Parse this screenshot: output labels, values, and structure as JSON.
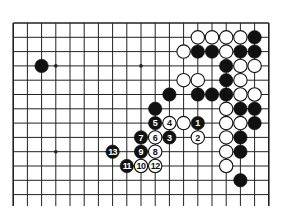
{
  "diagram": {
    "type": "go-board-partial",
    "board_columns": 19,
    "visible_rows": 13,
    "colors": {
      "black": "#111111",
      "white": "#ffffff",
      "line": "#222222",
      "background": "#ffffff"
    },
    "star_points": [
      [
        3,
        3
      ],
      [
        9,
        3
      ],
      [
        3,
        9
      ],
      [
        9,
        9
      ],
      [
        15,
        3
      ],
      [
        15,
        9
      ]
    ],
    "stones": [
      {
        "c": 2,
        "r": 3,
        "color": "black"
      },
      {
        "c": 13,
        "r": 1,
        "color": "white"
      },
      {
        "c": 14,
        "r": 1,
        "color": "white"
      },
      {
        "c": 15,
        "r": 1,
        "color": "white"
      },
      {
        "c": 16,
        "r": 1,
        "color": "white"
      },
      {
        "c": 17,
        "r": 1,
        "color": "black"
      },
      {
        "c": 12,
        "r": 2,
        "color": "white"
      },
      {
        "c": 13,
        "r": 2,
        "color": "black"
      },
      {
        "c": 14,
        "r": 2,
        "color": "black"
      },
      {
        "c": 15,
        "r": 2,
        "color": "white"
      },
      {
        "c": 16,
        "r": 2,
        "color": "black"
      },
      {
        "c": 17,
        "r": 2,
        "color": "black"
      },
      {
        "c": 15,
        "r": 3,
        "color": "black"
      },
      {
        "c": 16,
        "r": 3,
        "color": "white"
      },
      {
        "c": 17,
        "r": 3,
        "color": "white"
      },
      {
        "c": 12,
        "r": 4,
        "color": "white"
      },
      {
        "c": 13,
        "r": 4,
        "color": "white"
      },
      {
        "c": 15,
        "r": 4,
        "color": "black"
      },
      {
        "c": 16,
        "r": 4,
        "color": "white"
      },
      {
        "c": 11,
        "r": 5,
        "color": "black"
      },
      {
        "c": 13,
        "r": 5,
        "color": "black"
      },
      {
        "c": 14,
        "r": 5,
        "color": "black"
      },
      {
        "c": 15,
        "r": 5,
        "color": "black"
      },
      {
        "c": 16,
        "r": 5,
        "color": "white"
      },
      {
        "c": 17,
        "r": 5,
        "color": "white"
      },
      {
        "c": 10,
        "r": 6,
        "color": "black"
      },
      {
        "c": 15,
        "r": 6,
        "color": "white"
      },
      {
        "c": 16,
        "r": 6,
        "color": "black"
      },
      {
        "c": 17,
        "r": 6,
        "color": "black"
      },
      {
        "c": 10,
        "r": 7,
        "color": "black",
        "label": "5"
      },
      {
        "c": 11,
        "r": 7,
        "color": "white",
        "label": "4"
      },
      {
        "c": 12,
        "r": 7,
        "color": "white"
      },
      {
        "c": 13,
        "r": 7,
        "color": "black",
        "label": "1"
      },
      {
        "c": 15,
        "r": 7,
        "color": "white"
      },
      {
        "c": 16,
        "r": 7,
        "color": "white"
      },
      {
        "c": 17,
        "r": 7,
        "color": "black"
      },
      {
        "c": 9,
        "r": 8,
        "color": "black",
        "label": "7"
      },
      {
        "c": 10,
        "r": 8,
        "color": "white",
        "label": "6"
      },
      {
        "c": 11,
        "r": 8,
        "color": "black",
        "label": "3"
      },
      {
        "c": 13,
        "r": 8,
        "color": "white",
        "label": "2"
      },
      {
        "c": 15,
        "r": 8,
        "color": "white"
      },
      {
        "c": 16,
        "r": 8,
        "color": "black"
      },
      {
        "c": 7,
        "r": 9,
        "color": "black",
        "label": "13"
      },
      {
        "c": 9,
        "r": 9,
        "color": "black",
        "label": "9"
      },
      {
        "c": 10,
        "r": 9,
        "color": "white",
        "label": "8"
      },
      {
        "c": 15,
        "r": 9,
        "color": "white"
      },
      {
        "c": 16,
        "r": 9,
        "color": "black"
      },
      {
        "c": 8,
        "r": 10,
        "color": "black",
        "label": "11"
      },
      {
        "c": 9,
        "r": 10,
        "color": "white",
        "label": "10"
      },
      {
        "c": 10,
        "r": 10,
        "color": "white",
        "label": "12"
      },
      {
        "c": 15,
        "r": 10,
        "color": "white"
      },
      {
        "c": 16,
        "r": 11,
        "color": "black"
      }
    ]
  }
}
